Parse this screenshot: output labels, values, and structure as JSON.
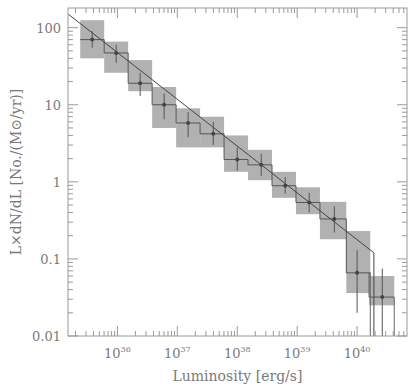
{
  "chart_data": {
    "type": "scatter",
    "title": "",
    "xlabel": "Luminosity [erg/s]",
    "ylabel": "L×dN/dL [No./(M⊙/yr)]",
    "xscale": "log",
    "yscale": "log",
    "xlim": [
      1.5e+35,
      6.8e+40
    ],
    "ylim": [
      0.01,
      180
    ],
    "x_ticks": [
      {
        "base": "10",
        "exp": "36",
        "value": 1e+36
      },
      {
        "base": "10",
        "exp": "37",
        "value": 1e+37
      },
      {
        "base": "10",
        "exp": "38",
        "value": 1e+38
      },
      {
        "base": "10",
        "exp": "39",
        "value": 1e+39
      },
      {
        "base": "10",
        "exp": "40",
        "value": 1e+40
      }
    ],
    "y_ticks": [
      {
        "label": "100",
        "value": 100
      },
      {
        "label": "10",
        "value": 10
      },
      {
        "label": "1",
        "value": 1
      },
      {
        "label": "0.1",
        "value": 0.1
      },
      {
        "label": "0.01",
        "value": 0.01
      }
    ],
    "grid": false,
    "series": [
      {
        "name": "binned data",
        "points": [
          {
            "logL": 35.58,
            "y": 70,
            "logL_lo": 35.38,
            "logL_hi": 35.78,
            "y_lo": 40,
            "y_hi": 125,
            "err_lo": 55,
            "err_hi": 90
          },
          {
            "logL": 35.98,
            "y": 47,
            "logL_lo": 35.78,
            "logL_hi": 36.18,
            "y_lo": 26,
            "y_hi": 66,
            "err_lo": 35,
            "err_hi": 60
          },
          {
            "logL": 36.38,
            "y": 19,
            "logL_lo": 36.18,
            "logL_hi": 36.58,
            "y_lo": 15,
            "y_hi": 38,
            "err_lo": 13,
            "err_hi": 26
          },
          {
            "logL": 36.78,
            "y": 10,
            "logL_lo": 36.58,
            "logL_hi": 36.98,
            "y_lo": 5.0,
            "y_hi": 17,
            "err_lo": 6.5,
            "err_hi": 14
          },
          {
            "logL": 37.18,
            "y": 5.8,
            "logL_lo": 36.98,
            "logL_hi": 37.38,
            "y_lo": 2.8,
            "y_hi": 9.0,
            "err_lo": 3.8,
            "err_hi": 8.0
          },
          {
            "logL": 37.6,
            "y": 4.2,
            "logL_lo": 37.38,
            "logL_hi": 37.78,
            "y_lo": 2.8,
            "y_hi": 7.0,
            "err_lo": 3.0,
            "err_hi": 6.0
          },
          {
            "logL": 38.0,
            "y": 1.95,
            "logL_lo": 37.78,
            "logL_hi": 38.18,
            "y_lo": 1.35,
            "y_hi": 4.0,
            "err_lo": 1.4,
            "err_hi": 2.8
          },
          {
            "logL": 38.4,
            "y": 1.66,
            "logL_lo": 38.18,
            "logL_hi": 38.58,
            "y_lo": 1.05,
            "y_hi": 2.6,
            "err_lo": 1.2,
            "err_hi": 2.3
          },
          {
            "logL": 38.8,
            "y": 0.89,
            "logL_lo": 38.58,
            "logL_hi": 38.98,
            "y_lo": 0.62,
            "y_hi": 1.35,
            "err_lo": 0.7,
            "err_hi": 1.15
          },
          {
            "logL": 39.2,
            "y": 0.54,
            "logL_lo": 38.98,
            "logL_hi": 39.38,
            "y_lo": 0.38,
            "y_hi": 0.85,
            "err_lo": 0.4,
            "err_hi": 0.72
          },
          {
            "logL": 39.62,
            "y": 0.33,
            "logL_lo": 39.38,
            "logL_hi": 39.82,
            "y_lo": 0.18,
            "y_hi": 0.55,
            "err_lo": 0.22,
            "err_hi": 0.48
          },
          {
            "logL": 40.0,
            "y": 0.066,
            "logL_lo": 39.82,
            "logL_hi": 40.22,
            "y_lo": 0.036,
            "y_hi": 0.23,
            "err_lo": 0.02,
            "err_hi": 0.13
          },
          {
            "logL": 40.42,
            "y": 0.032,
            "logL_lo": 40.2,
            "logL_hi": 40.62,
            "y_lo": 0.025,
            "y_hi": 0.06,
            "err_lo": 0.01,
            "err_hi": 0.075
          }
        ]
      },
      {
        "name": "power-law fit",
        "type": "line",
        "points": [
          {
            "logL": 35.18,
            "y": 150
          },
          {
            "logL": 40.28,
            "y": 0.12
          },
          {
            "logL": 40.28,
            "y": 0.01
          }
        ]
      }
    ],
    "legend": "none"
  }
}
